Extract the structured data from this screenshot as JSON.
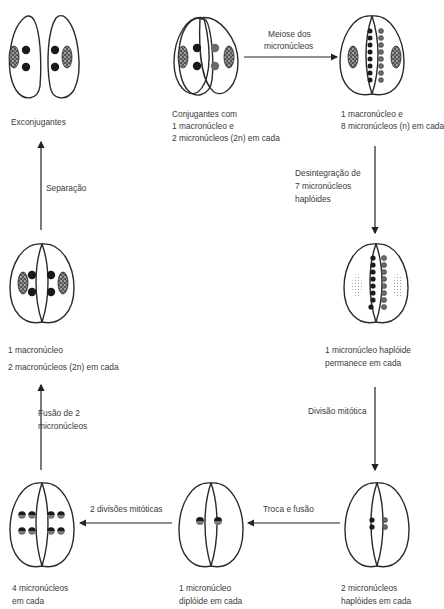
{
  "stages": {
    "exconjugants": {
      "label": "Exconjugantes"
    },
    "conjugants": {
      "line1": "Conjugantes com",
      "line2": "1 macronúcleo e",
      "line3": "2 micronúcleos (2n) em cada"
    },
    "after_meiosis": {
      "line1": "1 macronúcleo e",
      "line2": "8 micronúcleos (n) em cada"
    },
    "one_remains": {
      "line1": "1 micronúcleo haplóide",
      "line2": "permanece em cada"
    },
    "two_haploid": {
      "line1": "2 micronúcleos",
      "line2": "haplóides em cada"
    },
    "one_diploid": {
      "line1": "1 micronúcleo",
      "line2": "diplóide em cada"
    },
    "four_micro": {
      "line1": "4 micronúcleos",
      "line2": "em cada"
    },
    "before_separation": {
      "line1": "1 macronúcleo",
      "line2": "2 macronúcleos (2n) em cada"
    }
  },
  "arrows": {
    "meiosis": {
      "line1": "Meiose dos",
      "line2": "micronúcleos"
    },
    "disintegration": {
      "line1": "Desintegração de",
      "line2": "7 micronúcleos",
      "line3": "haplóides"
    },
    "mitotic_division": {
      "label": "Divisão mitótica"
    },
    "exchange_fusion": {
      "label": "Troca e fusão"
    },
    "two_mitotic": {
      "label": "2 divisões mitóticas"
    },
    "fusion_two": {
      "line1": "Fusão de 2",
      "line2": "micronúcleos"
    },
    "separation": {
      "label": "Separação"
    }
  },
  "colors": {
    "outline": "#2a2a2a",
    "dark_nucleus": "#1a1a1a",
    "grey_nucleus": "#6a6a6a",
    "text": "#3a3a3a"
  }
}
